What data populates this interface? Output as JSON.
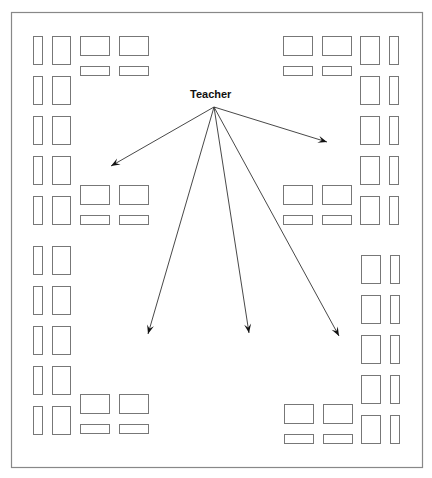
{
  "diagram": {
    "teacher_label": "Teacher",
    "arrow_count": 5,
    "groups": [
      {
        "name": "top-left-cluster"
      },
      {
        "name": "top-right-cluster"
      },
      {
        "name": "mid-left-cluster"
      },
      {
        "name": "mid-right-cluster"
      },
      {
        "name": "bottom-left-cluster"
      },
      {
        "name": "bottom-right-cluster"
      }
    ],
    "colors": {
      "stroke": "#777777",
      "arrow": "#333333",
      "background": "#ffffff"
    }
  }
}
